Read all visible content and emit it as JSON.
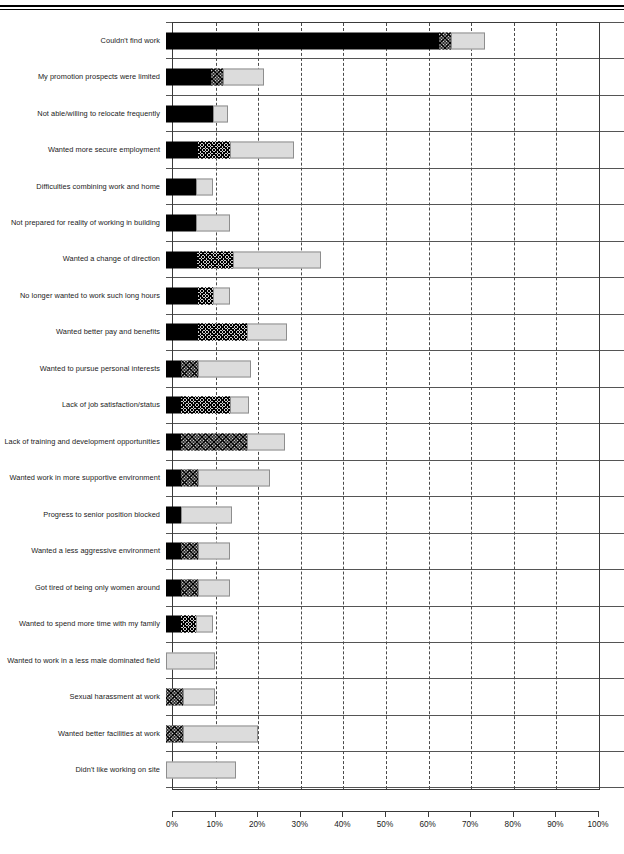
{
  "page": {
    "top_rule": true
  },
  "chart_data": {
    "type": "bar",
    "orientation": "horizontal",
    "stacked": true,
    "title": "",
    "xlabel": "",
    "ylabel": "",
    "xlim": [
      0,
      100
    ],
    "grid": true,
    "legend": "none",
    "xticks": [
      "0%",
      "10%",
      "20%",
      "30%",
      "40%",
      "50%",
      "60%",
      "70%",
      "80%",
      "90%",
      "100%"
    ],
    "xtick_values": [
      0,
      10,
      20,
      30,
      40,
      50,
      60,
      70,
      80,
      90,
      100
    ],
    "series": [
      {
        "name": "segment-1",
        "style": "solid-black",
        "color": "#000000"
      },
      {
        "name": "segment-2",
        "style": "cross-hatched",
        "color": "#cfcfcf"
      },
      {
        "name": "segment-3",
        "style": "light-grey",
        "color": "#dcdcdc"
      }
    ],
    "categories": [
      "Couldn't find work",
      "My promotion prospects were limited",
      "Not able/willing to relocate frequently",
      "Wanted more secure employment",
      "Difficulties combining work and home",
      "Not prepared for reality of working in building",
      "Wanted a change of direction",
      "No longer wanted to work such long hours",
      "Wanted better pay and benefits",
      "Wanted to pursue personal interests",
      "Lack of job satisfaction/status",
      "Lack of training and development opportunities",
      "Wanted work in more supportive environment",
      "Progress to senior position blocked",
      "Wanted a less aggressive environment",
      "Got tired of being only women around",
      "Wanted to spend more time with my family",
      "Wanted to work in a less male dominated field",
      "Sexual harassment at work",
      "Didn't like working on site"
    ],
    "rows": [
      {
        "label": "Couldn't find work",
        "values": [
          64.0,
          3.0,
          8.0
        ]
      },
      {
        "label": "My promotion prospects were limited",
        "values": [
          10.5,
          3.0,
          9.5
        ]
      },
      {
        "label": "Not able/willing to relocate frequently",
        "values": [
          11.0,
          0.0,
          3.5
        ]
      },
      {
        "label": "Wanted more secure employment",
        "values": [
          7.5,
          7.5,
          15.0
        ]
      },
      {
        "label": "Difficulties combining work and home",
        "values": [
          7.0,
          0.0,
          4.0
        ]
      },
      {
        "label": "Not prepared for reality of working in building",
        "values": [
          7.0,
          0.0,
          8.0
        ]
      },
      {
        "label": "Wanted a change of direction",
        "values": [
          7.3,
          8.4,
          20.7
        ]
      },
      {
        "label": "No longer wanted to work such long hours",
        "values": [
          7.5,
          3.5,
          4.0
        ]
      },
      {
        "label": "Wanted better pay and benefits",
        "values": [
          7.5,
          11.5,
          9.5
        ]
      },
      {
        "label": "Wanted to pursue personal interests",
        "values": [
          3.5,
          4.0,
          12.5
        ]
      },
      {
        "label": "Lack of job satisfaction/status",
        "values": [
          3.5,
          11.5,
          4.5
        ]
      },
      {
        "label": "Lack of training and development opportunities",
        "values": [
          3.5,
          15.5,
          9.0
        ]
      },
      {
        "label": "Wanted work in more supportive environment",
        "values": [
          3.5,
          4.0,
          17.0
        ]
      },
      {
        "label": "Progress to senior position blocked",
        "values": [
          3.5,
          0.0,
          12.0
        ]
      },
      {
        "label": "Wanted a less aggressive environment",
        "values": [
          3.5,
          4.0,
          7.5
        ]
      },
      {
        "label": "Got tired of being only women around",
        "values": [
          3.5,
          4.0,
          7.5
        ]
      },
      {
        "label": "Wanted to spend more time with my family",
        "values": [
          3.5,
          3.5,
          4.0
        ]
      },
      {
        "label": "Wanted to work in a less male dominated field",
        "values": [
          0.0,
          0.0,
          11.5
        ]
      },
      {
        "label": "Sexual harassment at work",
        "values": [
          0.0,
          4.0,
          7.5
        ]
      },
      {
        "label": "Wanted better facilities at work",
        "values": [
          0.0,
          4.0,
          17.5
        ]
      },
      {
        "label": "Didn't like working on site",
        "values": [
          0.0,
          0.0,
          16.5
        ]
      }
    ]
  }
}
